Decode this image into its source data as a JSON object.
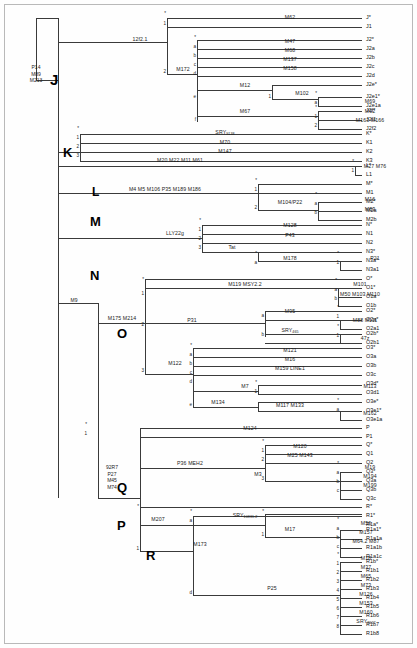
{
  "diagram": {
    "root_markers": [
      "P14",
      "M89",
      "M213"
    ],
    "m9_label": "M9",
    "p_node_markers": [
      "92R7",
      "P27",
      "M45",
      "M74"
    ],
    "clades": [
      {
        "letter": "J",
        "x": 50,
        "y": 72,
        "size": 15
      },
      {
        "letter": "K",
        "x": 63,
        "y": 146,
        "size": 13
      },
      {
        "letter": "L",
        "x": 92,
        "y": 186,
        "size": 12
      },
      {
        "letter": "M",
        "x": 90,
        "y": 215,
        "size": 13
      },
      {
        "letter": "N",
        "x": 90,
        "y": 269,
        "size": 13
      },
      {
        "letter": "O",
        "x": 117,
        "y": 327,
        "size": 13
      },
      {
        "letter": "Q",
        "x": 117,
        "y": 481,
        "size": 13
      },
      {
        "letter": "P",
        "x": 117,
        "y": 519,
        "size": 13
      },
      {
        "letter": "R",
        "x": 146,
        "y": 549,
        "size": 13
      }
    ],
    "branch_markers": [
      {
        "id": "m-12f2",
        "text": "12f2.1",
        "x": 140,
        "y": 42
      },
      {
        "id": "m-M62",
        "text": "M62",
        "x": 290,
        "y": 20
      },
      {
        "id": "m-M172",
        "text": "M172",
        "x": 183,
        "y": 72
      },
      {
        "id": "m-M47",
        "text": "M47",
        "x": 290,
        "y": 44
      },
      {
        "id": "m-M68",
        "text": "M68",
        "x": 290,
        "y": 53
      },
      {
        "id": "m-M137",
        "text": "M137",
        "x": 290,
        "y": 62
      },
      {
        "id": "m-M158",
        "text": "M158",
        "x": 290,
        "y": 71
      },
      {
        "id": "m-M12",
        "text": "M12",
        "x": 245,
        "y": 88
      },
      {
        "id": "m-M102",
        "text": "M102",
        "x": 302,
        "y": 96
      },
      {
        "id": "m-M69",
        "text": "M69",
        "x": 370,
        "y": 104
      },
      {
        "id": "m-M67",
        "text": "M67",
        "x": 245,
        "y": 114
      },
      {
        "id": "m-M92",
        "text": "M92",
        "x": 370,
        "y": 114
      },
      {
        "id": "m-M163",
        "text": "M163  M166",
        "x": 370,
        "y": 123
      },
      {
        "id": "m-SRY",
        "text": "SRY",
        "sub": "9138",
        "x": 225,
        "y": 135
      },
      {
        "id": "m-M70",
        "text": "M70",
        "x": 225,
        "y": 145
      },
      {
        "id": "m-M147",
        "text": "M147",
        "x": 225,
        "y": 154
      },
      {
        "id": "m-M20",
        "text": "M20  M22  M11  M61",
        "x": 180,
        "y": 163
      },
      {
        "id": "m-M27",
        "text": "M27  M76",
        "x": 375,
        "y": 169
      },
      {
        "id": "m-M4",
        "text": "M4   M5  M106  P35  M189  M186",
        "x": 165,
        "y": 192
      },
      {
        "id": "m-M104",
        "text": "M104/P22",
        "x": 290,
        "y": 205
      },
      {
        "id": "m-M16",
        "text": "M16",
        "x": 370,
        "y": 202
      },
      {
        "id": "m-M83",
        "text": "M83",
        "x": 370,
        "y": 212
      },
      {
        "id": "m-LLY22g",
        "text": "LLY22g",
        "x": 175,
        "y": 236
      },
      {
        "id": "m-M128",
        "text": "M128",
        "x": 290,
        "y": 228
      },
      {
        "id": "m-P43",
        "text": "P43",
        "x": 290,
        "y": 238
      },
      {
        "id": "m-Tat",
        "text": "Tat",
        "x": 232,
        "y": 250
      },
      {
        "id": "m-M178",
        "text": "M178",
        "x": 290,
        "y": 261
      },
      {
        "id": "m-P21",
        "text": "P21",
        "x": 375,
        "y": 261
      },
      {
        "id": "m-M175",
        "text": "M175  M214",
        "x": 122,
        "y": 321
      },
      {
        "id": "m-M119",
        "text": "M119  MSY2.2",
        "x": 245,
        "y": 287
      },
      {
        "id": "m-M101",
        "text": "M101",
        "x": 360,
        "y": 287
      },
      {
        "id": "m-M50",
        "text": "M50  M103  M110",
        "x": 360,
        "y": 297
      },
      {
        "id": "m-P31",
        "text": "P31",
        "x": 192,
        "y": 323
      },
      {
        "id": "m-M95",
        "text": "M95",
        "x": 290,
        "y": 314
      },
      {
        "id": "m-M88",
        "text": "M88  M111",
        "x": 365,
        "y": 323
      },
      {
        "id": "m-SRY465",
        "text": "SRY",
        "sub": "465",
        "x": 290,
        "y": 333
      },
      {
        "id": "m-47z",
        "text": "47z",
        "x": 365,
        "y": 341
      },
      {
        "id": "m-M122",
        "text": "M122",
        "x": 175,
        "y": 366
      },
      {
        "id": "m-M121",
        "text": "M121",
        "x": 290,
        "y": 353
      },
      {
        "id": "m-M164",
        "text": "M16",
        "x": 290,
        "y": 362
      },
      {
        "id": "m-M159",
        "text": "M159  LINE1",
        "x": 290,
        "y": 371
      },
      {
        "id": "m-M7",
        "text": "M7",
        "x": 245,
        "y": 389
      },
      {
        "id": "m-M113",
        "text": "M113",
        "x": 370,
        "y": 389
      },
      {
        "id": "m-M134",
        "text": "M134",
        "x": 218,
        "y": 405
      },
      {
        "id": "m-M117",
        "text": "M117  M133",
        "x": 290,
        "y": 408
      },
      {
        "id": "m-M162",
        "text": "M162",
        "x": 370,
        "y": 416
      },
      {
        "id": "m-M124",
        "text": "M124",
        "x": 250,
        "y": 431
      },
      {
        "id": "m-P36",
        "text": "P36  MEH2",
        "x": 190,
        "y": 466
      },
      {
        "id": "m-M120",
        "text": "M120",
        "x": 300,
        "y": 449
      },
      {
        "id": "m-M25",
        "text": "M25  M143",
        "x": 300,
        "y": 458
      },
      {
        "id": "m-M3",
        "text": "M3",
        "x": 258,
        "y": 477
      },
      {
        "id": "m-M19",
        "text": "M19",
        "x": 370,
        "y": 470
      },
      {
        "id": "m-M194",
        "text": "M194",
        "x": 370,
        "y": 479
      },
      {
        "id": "m-M199",
        "text": "M199",
        "x": 370,
        "y": 488
      },
      {
        "id": "m-M207",
        "text": "M207",
        "x": 158,
        "y": 522
      },
      {
        "id": "m-SRY1532",
        "text": "SRY",
        "sub": "10831.2",
        "x": 245,
        "y": 518
      },
      {
        "id": "m-M17",
        "text": "M17",
        "x": 290,
        "y": 532
      },
      {
        "id": "m-M56",
        "text": "M56",
        "x": 366,
        "y": 526
      },
      {
        "id": "m-M157",
        "text": "M157",
        "x": 366,
        "y": 535
      },
      {
        "id": "m-M64",
        "text": "M64.2  M87",
        "x": 366,
        "y": 544
      },
      {
        "id": "m-M173",
        "text": "M173",
        "x": 200,
        "y": 547
      },
      {
        "id": "m-P25",
        "text": "P25",
        "x": 272,
        "y": 591
      },
      {
        "id": "m-M18",
        "text": "M18",
        "x": 366,
        "y": 561
      },
      {
        "id": "m-M37",
        "text": "M37",
        "x": 366,
        "y": 570
      },
      {
        "id": "m-M65",
        "text": "M65",
        "x": 366,
        "y": 579
      },
      {
        "id": "m-M73",
        "text": "M73",
        "x": 366,
        "y": 588
      },
      {
        "id": "m-M126",
        "text": "M126",
        "x": 366,
        "y": 597
      },
      {
        "id": "m-M153",
        "text": "M153",
        "x": 366,
        "y": 606
      },
      {
        "id": "m-M160",
        "text": "M160",
        "x": 366,
        "y": 615
      },
      {
        "id": "m-SRY2627",
        "text": "SRY",
        "sub": "2627",
        "x": 366,
        "y": 624
      }
    ],
    "branch_labels": [
      {
        "text": "*",
        "x": 167,
        "y": 16
      },
      {
        "text": "1",
        "x": 167,
        "y": 26
      },
      {
        "text": "2",
        "x": 167,
        "y": 74
      },
      {
        "text": "*",
        "x": 197,
        "y": 40
      },
      {
        "text": "a",
        "x": 197,
        "y": 49
      },
      {
        "text": "b",
        "x": 197,
        "y": 58
      },
      {
        "text": "c",
        "x": 197,
        "y": 67
      },
      {
        "text": "d",
        "x": 197,
        "y": 76
      },
      {
        "text": "e",
        "x": 197,
        "y": 99
      },
      {
        "text": "f",
        "x": 197,
        "y": 122
      },
      {
        "text": "1",
        "x": 272,
        "y": 99
      },
      {
        "text": "*",
        "x": 318,
        "y": 96
      },
      {
        "text": "a",
        "x": 318,
        "y": 105
      },
      {
        "text": "*",
        "x": 318,
        "y": 110
      },
      {
        "text": "1",
        "x": 318,
        "y": 119
      },
      {
        "text": "2",
        "x": 318,
        "y": 128
      },
      {
        "text": "*",
        "x": 80,
        "y": 131
      },
      {
        "text": "1",
        "x": 80,
        "y": 140
      },
      {
        "text": "2",
        "x": 80,
        "y": 149
      },
      {
        "text": "3",
        "x": 80,
        "y": 158
      },
      {
        "text": "*",
        "x": 355,
        "y": 164
      },
      {
        "text": "1",
        "x": 355,
        "y": 173
      },
      {
        "text": "*",
        "x": 258,
        "y": 183
      },
      {
        "text": "1",
        "x": 258,
        "y": 192
      },
      {
        "text": "2",
        "x": 258,
        "y": 210
      },
      {
        "text": "*",
        "x": 318,
        "y": 197
      },
      {
        "text": "a",
        "x": 318,
        "y": 206
      },
      {
        "text": "b",
        "x": 318,
        "y": 215
      },
      {
        "text": "*",
        "x": 202,
        "y": 223
      },
      {
        "text": "1",
        "x": 202,
        "y": 232
      },
      {
        "text": "2",
        "x": 202,
        "y": 241
      },
      {
        "text": "3",
        "x": 202,
        "y": 250
      },
      {
        "text": "*",
        "x": 258,
        "y": 256
      },
      {
        "text": "a",
        "x": 258,
        "y": 265
      },
      {
        "text": "*",
        "x": 340,
        "y": 256
      },
      {
        "text": "1",
        "x": 340,
        "y": 265
      },
      {
        "text": "*",
        "x": 145,
        "y": 282
      },
      {
        "text": "1",
        "x": 145,
        "y": 296
      },
      {
        "text": "2",
        "x": 145,
        "y": 327
      },
      {
        "text": "3",
        "x": 145,
        "y": 373
      },
      {
        "text": "*",
        "x": 338,
        "y": 283
      },
      {
        "text": "a",
        "x": 338,
        "y": 292
      },
      {
        "text": "b",
        "x": 338,
        "y": 301
      },
      {
        "text": "a",
        "x": 265,
        "y": 318
      },
      {
        "text": "b",
        "x": 265,
        "y": 337
      },
      {
        "text": "*",
        "x": 340,
        "y": 310
      },
      {
        "text": "1",
        "x": 340,
        "y": 319
      },
      {
        "text": "*",
        "x": 340,
        "y": 329
      },
      {
        "text": "1",
        "x": 340,
        "y": 338
      },
      {
        "text": "*",
        "x": 193,
        "y": 348
      },
      {
        "text": "a",
        "x": 193,
        "y": 357
      },
      {
        "text": "b",
        "x": 193,
        "y": 366
      },
      {
        "text": "c",
        "x": 193,
        "y": 375
      },
      {
        "text": "d",
        "x": 193,
        "y": 384
      },
      {
        "text": "e",
        "x": 193,
        "y": 407
      },
      {
        "text": "*",
        "x": 258,
        "y": 385
      },
      {
        "text": "1",
        "x": 258,
        "y": 394
      },
      {
        "text": "*",
        "x": 340,
        "y": 403
      },
      {
        "text": "a",
        "x": 340,
        "y": 412
      },
      {
        "text": "*",
        "x": 88,
        "y": 427
      },
      {
        "text": "1",
        "x": 88,
        "y": 436
      },
      {
        "text": "*",
        "x": 265,
        "y": 444
      },
      {
        "text": "1",
        "x": 265,
        "y": 453
      },
      {
        "text": "2",
        "x": 265,
        "y": 462
      },
      {
        "text": "3",
        "x": 265,
        "y": 481
      },
      {
        "text": "*",
        "x": 340,
        "y": 466
      },
      {
        "text": "a",
        "x": 340,
        "y": 475
      },
      {
        "text": "b",
        "x": 340,
        "y": 484
      },
      {
        "text": "c",
        "x": 340,
        "y": 493
      },
      {
        "text": "*",
        "x": 140,
        "y": 509
      },
      {
        "text": "1",
        "x": 140,
        "y": 551
      },
      {
        "text": "*",
        "x": 193,
        "y": 514
      },
      {
        "text": "a",
        "x": 193,
        "y": 523
      },
      {
        "text": "d",
        "x": 193,
        "y": 595
      },
      {
        "text": "*",
        "x": 265,
        "y": 514
      },
      {
        "text": "1",
        "x": 265,
        "y": 537
      },
      {
        "text": "*",
        "x": 340,
        "y": 522
      },
      {
        "text": "a",
        "x": 340,
        "y": 531
      },
      {
        "text": "b",
        "x": 340,
        "y": 540
      },
      {
        "text": "c",
        "x": 340,
        "y": 549
      },
      {
        "text": "*",
        "x": 340,
        "y": 557
      },
      {
        "text": "1",
        "x": 340,
        "y": 566
      },
      {
        "text": "2",
        "x": 340,
        "y": 575
      },
      {
        "text": "3",
        "x": 340,
        "y": 584
      },
      {
        "text": "4",
        "x": 340,
        "y": 593
      },
      {
        "text": "5",
        "x": 340,
        "y": 602
      },
      {
        "text": "6",
        "x": 340,
        "y": 611
      },
      {
        "text": "7",
        "x": 340,
        "y": 620
      },
      {
        "text": "8",
        "x": 340,
        "y": 629
      }
    ],
    "haplogroups": [
      {
        "name": "J*",
        "y": 18
      },
      {
        "name": "J1",
        "y": 27
      },
      {
        "name": "J2*",
        "y": 40
      },
      {
        "name": "J2a",
        "y": 49
      },
      {
        "name": "J2b",
        "y": 58
      },
      {
        "name": "J2c",
        "y": 67
      },
      {
        "name": "J2d",
        "y": 76
      },
      {
        "name": "J2e*",
        "y": 85
      },
      {
        "name": "J2e1*",
        "y": 97
      },
      {
        "name": "J2e1a",
        "y": 106
      },
      {
        "name": "J2f*",
        "y": 111
      },
      {
        "name": "J2f1",
        "y": 120
      },
      {
        "name": "J2f2",
        "y": 129
      },
      {
        "name": "K*",
        "y": 134
      },
      {
        "name": "K1",
        "y": 143
      },
      {
        "name": "K2",
        "y": 152
      },
      {
        "name": "K3",
        "y": 161
      },
      {
        "name": "L*",
        "y": 166
      },
      {
        "name": "L1",
        "y": 175
      },
      {
        "name": "M*",
        "y": 184
      },
      {
        "name": "M1",
        "y": 193
      },
      {
        "name": "M2*",
        "y": 202
      },
      {
        "name": "M2a",
        "y": 211
      },
      {
        "name": "M2b",
        "y": 220
      },
      {
        "name": "N*",
        "y": 225
      },
      {
        "name": "N1",
        "y": 234
      },
      {
        "name": "N2",
        "y": 243
      },
      {
        "name": "N3*",
        "y": 252
      },
      {
        "name": "N3a*",
        "y": 261
      },
      {
        "name": "N3a1",
        "y": 270
      },
      {
        "name": "O*",
        "y": 279
      },
      {
        "name": "O1*",
        "y": 288
      },
      {
        "name": "O1a",
        "y": 297
      },
      {
        "name": "O1b",
        "y": 306
      },
      {
        "name": "O2*",
        "y": 311
      },
      {
        "name": "O2a*",
        "y": 320
      },
      {
        "name": "O2a1",
        "y": 329
      },
      {
        "name": "O2b*",
        "y": 334
      },
      {
        "name": "O2b1",
        "y": 343
      },
      {
        "name": "O3*",
        "y": 348
      },
      {
        "name": "O3a",
        "y": 357
      },
      {
        "name": "O3b",
        "y": 366
      },
      {
        "name": "O3c",
        "y": 375
      },
      {
        "name": "O3d*",
        "y": 384
      },
      {
        "name": "O3d1",
        "y": 393
      },
      {
        "name": "O3e*",
        "y": 402
      },
      {
        "name": "O3e1*",
        "y": 411
      },
      {
        "name": "O3e1a",
        "y": 420
      },
      {
        "name": "P",
        "y": 428
      },
      {
        "name": "P1",
        "y": 437
      },
      {
        "name": "Q*",
        "y": 445
      },
      {
        "name": "Q1",
        "y": 454
      },
      {
        "name": "Q2",
        "y": 463
      },
      {
        "name": "Q3*",
        "y": 472
      },
      {
        "name": "Q3a",
        "y": 481
      },
      {
        "name": "Q3b",
        "y": 490
      },
      {
        "name": "Q3c",
        "y": 499
      },
      {
        "name": "R*",
        "y": 507
      },
      {
        "name": "R1*",
        "y": 516
      },
      {
        "name": "R1a*",
        "y": 525
      },
      {
        "name": "R1a1*",
        "y": 530
      },
      {
        "name": "R1a1a",
        "y": 539
      },
      {
        "name": "R1a1b",
        "y": 548
      },
      {
        "name": "R1a1c",
        "y": 557
      },
      {
        "name": "R1b*",
        "y": 562
      },
      {
        "name": "R1b1",
        "y": 571
      },
      {
        "name": "R1b2",
        "y": 580
      },
      {
        "name": "R1b3",
        "y": 589
      },
      {
        "name": "R1b4",
        "y": 598
      },
      {
        "name": "R1b5",
        "y": 607
      },
      {
        "name": "R1b6",
        "y": 616
      },
      {
        "name": "R1b7",
        "y": 625
      },
      {
        "name": "R1b8",
        "y": 634
      }
    ]
  }
}
